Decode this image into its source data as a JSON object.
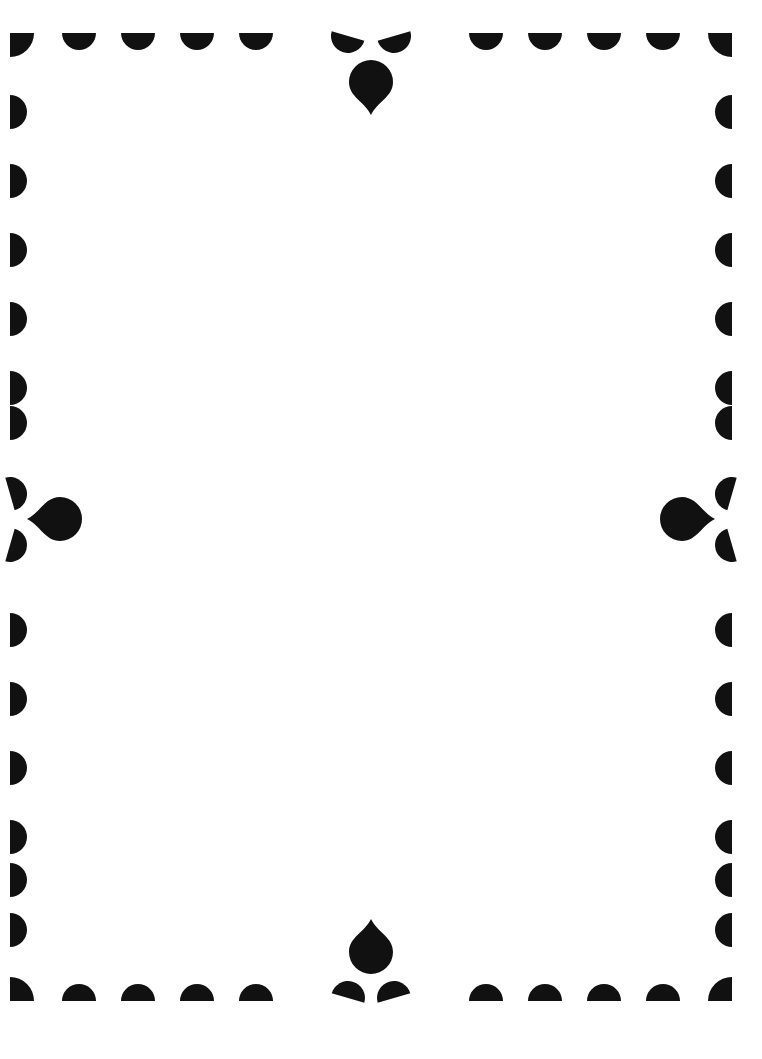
{
  "document": {
    "type": "decorative-page-border",
    "title": "Scalloped Teardrop Frame",
    "canvas": {
      "width": 762,
      "height": 1059
    },
    "colors": {
      "background": "#ffffff",
      "ink": "#111111",
      "paper_edge": "#fdfdfd"
    },
    "frame": {
      "left": 10,
      "top": 33,
      "right": 732,
      "bottom": 1001,
      "note": "Inner rectangle the ornaments are anchored to"
    },
    "motifs": {
      "corner": {
        "name": "quarter-circle-corner",
        "count": 4,
        "radius": 24,
        "description": "Quarter round wedge, flat along the two outer edges, rounded toward the interior"
      },
      "scallop": {
        "name": "half-circle-scallop",
        "radius": 17,
        "description": "Semicircle with flat side on the frame line, bulging toward the interior"
      },
      "teardrop": {
        "name": "teardrop-drop",
        "count": 4,
        "radius": 23,
        "point_length": 30,
        "description": "Circle with a drawn-out point aimed outward, centered on each side"
      },
      "tilted_scallop": {
        "name": "tilted-half-circle-scallop",
        "count": 8,
        "tilt_degrees": 18,
        "description": "Semicircle rotated to flank each centered teardrop"
      }
    },
    "edges": [
      {
        "id": "top",
        "label": "Top edge",
        "scallops_per_half": 4,
        "spacing": 59,
        "center_ornament": "teardrop-up"
      },
      {
        "id": "bottom",
        "label": "Bottom edge",
        "scallops_per_half": 4,
        "spacing": 59,
        "center_ornament": "teardrop-down"
      },
      {
        "id": "left",
        "label": "Left edge",
        "scallops_per_half": 6,
        "spacing": 69,
        "center_ornament": "teardrop-left"
      },
      {
        "id": "right",
        "label": "Right edge",
        "scallops_per_half": 6,
        "spacing": 69,
        "center_ornament": "teardrop-right"
      }
    ],
    "corners": [
      {
        "id": "top-left",
        "label": "Top left corner",
        "x": 10,
        "y": 33
      },
      {
        "id": "top-right",
        "label": "Top right corner",
        "x": 732,
        "y": 33
      },
      {
        "id": "bottom-left",
        "label": "Bottom left corner",
        "x": 10,
        "y": 1001
      },
      {
        "id": "bottom-right",
        "label": "Bottom right corner",
        "x": 732,
        "y": 1001
      }
    ],
    "content_area": {
      "label": "Blank content area",
      "text": "",
      "x": 40,
      "y": 60,
      "width": 682,
      "height": 915
    }
  }
}
